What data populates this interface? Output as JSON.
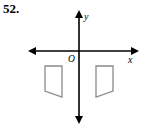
{
  "problem": {
    "number": "52."
  },
  "figure": {
    "name": "coordinate-plane-with-two-quadrilaterals",
    "colors": {
      "background": "#ffffff",
      "axis": "#000000",
      "shape_stroke": "#8a8a8a",
      "shape_fill": "#ffffff",
      "text": "#000000"
    },
    "axes": {
      "x_label": "x",
      "y_label": "y",
      "origin_label": "O",
      "origin": {
        "x": 79,
        "y": 51
      },
      "x_axis": {
        "x1": 29,
        "y1": 51,
        "x2": 138,
        "y2": 51,
        "arrows": "both"
      },
      "y_axis": {
        "x1": 79,
        "y1": 11,
        "x2": 79,
        "y2": 123,
        "arrows": "both"
      },
      "stroke_width": 1.6,
      "arrow_size": 5
    },
    "shapes": [
      {
        "name": "left-quadrilateral",
        "quadrant": "III",
        "points": "45,66 62,66 62,97 45,91"
      },
      {
        "name": "right-quadrilateral",
        "quadrant": "IV",
        "points": "113,66 96,66 96,97 113,91"
      }
    ],
    "label_positions": {
      "x": {
        "x": 129,
        "y": 62
      },
      "y": {
        "x": 84,
        "y": 19
      },
      "origin": {
        "x": 68,
        "y": 62
      }
    }
  }
}
